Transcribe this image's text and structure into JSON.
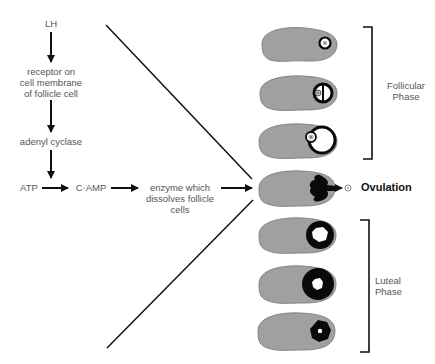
{
  "diagram": {
    "pathway": {
      "lh": "LH",
      "receptor_line1": "receptor on",
      "receptor_line2": "cell membrane",
      "receptor_line3": "of follicle cell",
      "adenyl": "adenyl cyclase",
      "atp": "ATP",
      "camp": "C·AMP",
      "enzyme_line1": "enzyme which",
      "enzyme_line2": "dissolves follicle",
      "enzyme_line3": "cells"
    },
    "phases": {
      "follicular_line1": "Follicular",
      "follicular_line2": "Phase",
      "ovulation": "Ovulation",
      "luteal_line1": "Luteal",
      "luteal_line2": "Phase"
    },
    "ovaries": [
      {
        "stage": "primary follicle"
      },
      {
        "stage": "developing follicle with antrum"
      },
      {
        "stage": "mature Graafian follicle"
      },
      {
        "stage": "ovulation - ovum released"
      },
      {
        "stage": "corpus luteum forming"
      },
      {
        "stage": "mature corpus luteum"
      },
      {
        "stage": "regressing corpus luteum"
      }
    ],
    "colors": {
      "ovary_fill": "#a0a0a0",
      "ovary_stroke": "#555555",
      "follicle": "#0a0a0a",
      "text": "#555555",
      "arrow": "#111111"
    }
  }
}
